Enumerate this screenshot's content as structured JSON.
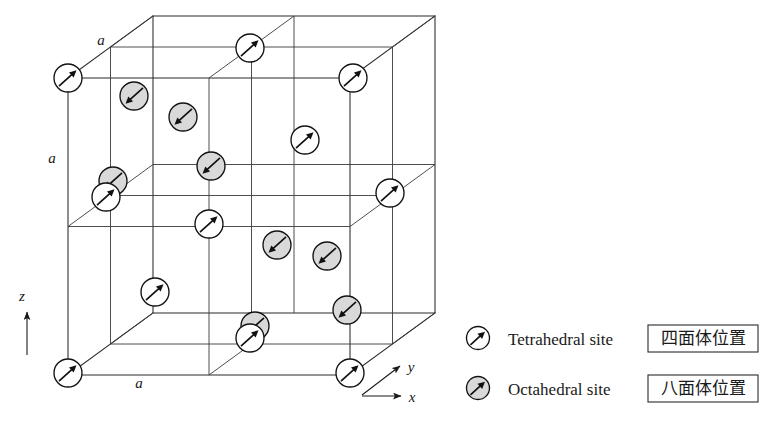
{
  "figure": {
    "lattice_labels": [
      {
        "id": "a-top",
        "text": "a",
        "x": 101,
        "y": 45
      },
      {
        "id": "a-left",
        "text": "a",
        "x": 52,
        "y": 163
      },
      {
        "id": "a-bottom",
        "text": "a",
        "x": 139,
        "y": 388
      }
    ],
    "axes": {
      "z": {
        "label": "z",
        "x": 22,
        "y": 301
      },
      "y": {
        "label": "y",
        "x": 411,
        "y": 372
      },
      "x": {
        "label": "x",
        "x": 412,
        "y": 402
      }
    }
  },
  "legend": {
    "entries": [
      {
        "icon": "tetrahedral-site-icon",
        "label": "Tetrahedral site",
        "japanese": "四面体位置",
        "fill": "#ffffff",
        "arrow": "up-right"
      },
      {
        "icon": "octahedral-site-icon",
        "label": "Octahedral site",
        "japanese": "八面体位置",
        "fill": "#d9d9d9",
        "arrow": "up-right"
      }
    ]
  },
  "colors": {
    "tetrahedral_fill": "#ffffff",
    "octahedral_fill": "#d9d9d9",
    "stroke": "#111111",
    "cell_line": "#2b2b2b",
    "background": "#ffffff"
  },
  "chart_data": {
    "type": "scatter",
    "xlabel": "x",
    "ylabel": "y",
    "zlabel": "z",
    "cube": {
      "front_face": [
        [
          68,
          78
        ],
        [
          350,
          78
        ],
        [
          350,
          375
        ],
        [
          68,
          375
        ]
      ],
      "depth_offset": [
        85,
        -62
      ],
      "subdivisions": 2,
      "edge_label": "a"
    },
    "sites": [
      {
        "type": "tetrahedral",
        "cx": 68,
        "cy": 78,
        "r": 14,
        "arrow": "up-right"
      },
      {
        "type": "tetrahedral",
        "cx": 250,
        "cy": 48,
        "r": 14,
        "arrow": "up-right"
      },
      {
        "type": "tetrahedral",
        "cx": 353,
        "cy": 78,
        "r": 14,
        "arrow": "up-right"
      },
      {
        "type": "octahedral",
        "cx": 134,
        "cy": 96,
        "r": 14,
        "arrow": "down-left"
      },
      {
        "type": "octahedral",
        "cx": 183,
        "cy": 117,
        "r": 14,
        "arrow": "down-left"
      },
      {
        "type": "tetrahedral",
        "cx": 305,
        "cy": 140,
        "r": 14,
        "arrow": "up-right"
      },
      {
        "type": "octahedral",
        "cx": 211,
        "cy": 166,
        "r": 14,
        "arrow": "down-left"
      },
      {
        "type": "octahedral",
        "cx": 113,
        "cy": 181,
        "r": 14,
        "arrow": "down-left"
      },
      {
        "type": "tetrahedral",
        "cx": 106,
        "cy": 197,
        "r": 14,
        "arrow": "up-right"
      },
      {
        "type": "tetrahedral",
        "cx": 390,
        "cy": 193,
        "r": 14,
        "arrow": "up-right"
      },
      {
        "type": "tetrahedral",
        "cx": 209,
        "cy": 224,
        "r": 14,
        "arrow": "up-right"
      },
      {
        "type": "octahedral",
        "cx": 277,
        "cy": 245,
        "r": 14,
        "arrow": "down-left"
      },
      {
        "type": "octahedral",
        "cx": 327,
        "cy": 256,
        "r": 14,
        "arrow": "down-left"
      },
      {
        "type": "tetrahedral",
        "cx": 155,
        "cy": 292,
        "r": 14,
        "arrow": "up-right"
      },
      {
        "type": "octahedral",
        "cx": 347,
        "cy": 310,
        "r": 14,
        "arrow": "down-left"
      },
      {
        "type": "octahedral",
        "cx": 255,
        "cy": 326,
        "r": 14,
        "arrow": "down-left"
      },
      {
        "type": "tetrahedral",
        "cx": 250,
        "cy": 338,
        "r": 14,
        "arrow": "up-right"
      },
      {
        "type": "tetrahedral",
        "cx": 68,
        "cy": 373,
        "r": 14,
        "arrow": "up-right"
      },
      {
        "type": "tetrahedral",
        "cx": 350,
        "cy": 373,
        "r": 14,
        "arrow": "up-right"
      }
    ],
    "legend_position": "right"
  }
}
